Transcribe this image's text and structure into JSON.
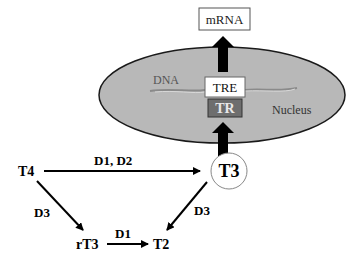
{
  "diagram": {
    "nucleus": {
      "label": "Nucleus",
      "fill": "#b8b8b8",
      "stroke": "#1a1a1a"
    },
    "dna_label": "DNA",
    "tre": {
      "label": "TRE",
      "fill": "#ffffff"
    },
    "tr": {
      "label": "TR",
      "fill": "#6e6e6e",
      "text_color": "#e8e8e8"
    },
    "mrna": {
      "label": "mRNA"
    },
    "hormones": {
      "t4": "T4",
      "t3": "T3",
      "rt3": "rT3",
      "t2": "T2"
    },
    "enzymes": {
      "t4_to_t3": "D1, D2",
      "t4_to_rt3": "D3",
      "t3_to_t2": "D3",
      "rt3_to_t2": "D1"
    }
  }
}
